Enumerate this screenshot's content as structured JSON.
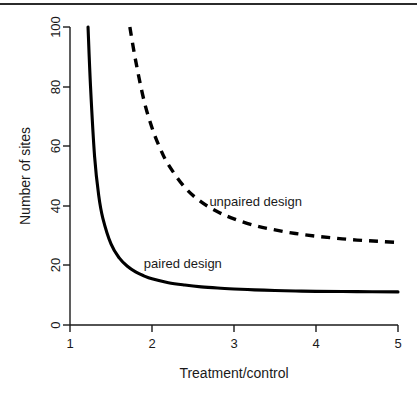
{
  "chart_data": {
    "type": "line",
    "title": "",
    "xlabel": "Treatment/control",
    "ylabel": "Number of sites",
    "xlim": [
      1,
      5
    ],
    "ylim": [
      0,
      100
    ],
    "xticks": [
      1,
      2,
      3,
      4,
      5
    ],
    "yticks": [
      0,
      20,
      40,
      60,
      80,
      100
    ],
    "xtick_labels": [
      "1",
      "2",
      "3",
      "4",
      "5"
    ],
    "ytick_labels": [
      "0",
      "20",
      "40",
      "60",
      "80",
      "100"
    ],
    "grid": false,
    "legend_position": "inline-annotations",
    "series": [
      {
        "name": "paired design",
        "style": "solid",
        "color": "#000000",
        "label_text": "paired design",
        "x": [
          1.22,
          1.25,
          1.3,
          1.35,
          1.4,
          1.5,
          1.6,
          1.7,
          1.8,
          1.9,
          2.0,
          2.2,
          2.4,
          2.6,
          2.8,
          3.0,
          3.25,
          3.5,
          3.75,
          4.0,
          4.5,
          5.0
        ],
        "y": [
          100.0,
          80.2,
          56.5,
          43.5,
          35.9,
          27.2,
          22.5,
          19.7,
          17.8,
          16.5,
          15.5,
          14.2,
          13.4,
          12.8,
          12.4,
          12.1,
          11.8,
          11.6,
          11.4,
          11.3,
          11.2,
          11.1
        ]
      },
      {
        "name": "unpaired design",
        "style": "dashed",
        "color": "#000000",
        "label_text": "unpaired design",
        "x": [
          1.73,
          1.8,
          1.9,
          2.0,
          2.1,
          2.2,
          2.4,
          2.6,
          2.8,
          3.0,
          3.25,
          3.5,
          3.75,
          4.0,
          4.25,
          4.5,
          4.75,
          5.0
        ],
        "y": [
          100.0,
          88.8,
          75.6,
          66.2,
          59.2,
          53.8,
          46.2,
          41.3,
          38.0,
          35.6,
          33.4,
          31.9,
          30.7,
          29.8,
          29.1,
          28.5,
          28.1,
          27.7
        ]
      }
    ],
    "annotations": [
      {
        "text": "paired design",
        "x": 1.9,
        "y": 19
      },
      {
        "text": "unpaired design",
        "x": 2.7,
        "y": 40
      }
    ]
  },
  "axes": {
    "y_title": "Number of sites",
    "x_title": "Treatment/control",
    "y_tick_0": "0",
    "y_tick_1": "20",
    "y_tick_2": "40",
    "y_tick_3": "60",
    "y_tick_4": "80",
    "y_tick_5": "100",
    "x_tick_0": "1",
    "x_tick_1": "2",
    "x_tick_2": "3",
    "x_tick_3": "4",
    "x_tick_4": "5"
  },
  "labels": {
    "paired": "paired design",
    "unpaired": "unpaired design"
  }
}
